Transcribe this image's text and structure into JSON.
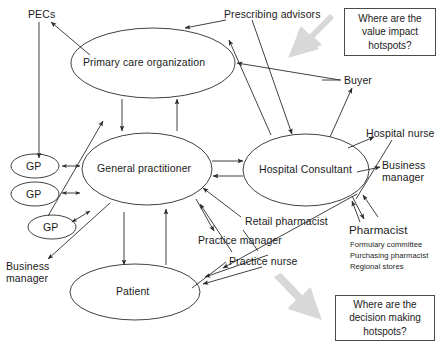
{
  "diagram": {
    "canvas": {
      "width": 441,
      "height": 346
    },
    "style": {
      "stroke": "#2b2b2b",
      "gray_arrow_fill": "#d4d4d4",
      "text_color": "#1b1b1b",
      "background": "#ffffff"
    },
    "ellipses": [
      {
        "id": "primary-care-organization",
        "label": "Primary care organization",
        "cx": 153,
        "cy": 63,
        "rx": 82,
        "ry": 35
      },
      {
        "id": "general-practitioner",
        "label": "General practitioner",
        "cx": 147,
        "cy": 169,
        "rx": 65,
        "ry": 36
      },
      {
        "id": "hospital-consultant",
        "label": "Hospital Consultant",
        "cx": 306,
        "cy": 170,
        "rx": 63,
        "ry": 36
      },
      {
        "id": "patient",
        "label": "Patient",
        "cx": 135,
        "cy": 292,
        "rx": 65,
        "ry": 28
      }
    ],
    "gp_nodes": [
      {
        "id": "gp-1",
        "label": "GP",
        "cx": 35,
        "cy": 166,
        "rx": 24,
        "ry": 12
      },
      {
        "id": "gp-2",
        "label": "GP",
        "cx": 35,
        "cy": 194,
        "rx": 24,
        "ry": 12
      },
      {
        "id": "gp-3",
        "label": "GP",
        "cx": 52,
        "cy": 227,
        "rx": 24,
        "ry": 12
      }
    ],
    "text_nodes": [
      {
        "id": "pecs",
        "label": "PECs",
        "x": 28,
        "y": 8
      },
      {
        "id": "prescribing-advisors",
        "label": "Prescribing advisors",
        "x": 224,
        "y": 8
      },
      {
        "id": "buyer",
        "label": "Buyer",
        "x": 344,
        "y": 75
      },
      {
        "id": "hospital-nurse",
        "label": "Hospital nurse",
        "x": 365,
        "y": 128
      },
      {
        "id": "business-manager-right",
        "label": "Business\nmanager",
        "x": 381,
        "y": 160
      },
      {
        "id": "retail-pharmacist",
        "label": "Retail pharmacist",
        "x": 243,
        "y": 216
      },
      {
        "id": "practice-manager",
        "label": "Practice manager",
        "x": 198,
        "y": 235
      },
      {
        "id": "practice-nurse",
        "label": "Practice nurse",
        "x": 229,
        "y": 256
      },
      {
        "id": "business-manager-left",
        "label": "Business\nmanager",
        "x": 6,
        "y": 260
      },
      {
        "id": "pharmacist",
        "label": "Pharmacist",
        "x": 348,
        "y": 225
      }
    ],
    "pharmacist_sub_items": [
      "Formulary committee",
      "Purchasing pharmacist",
      "Regional stores"
    ],
    "callouts": [
      {
        "id": "value-impact-hotspots",
        "lines": [
          "Where are the",
          "value impact",
          "hotspots?"
        ],
        "x": 344,
        "y": 8,
        "w": 92,
        "h": 48
      },
      {
        "id": "decision-making-hotspots",
        "lines": [
          "Where are the",
          "decision making",
          "hotspots?"
        ],
        "x": 335,
        "y": 295,
        "w": 100,
        "h": 46
      }
    ],
    "gray_arrows": [
      {
        "id": "value-impact-gray-arrow",
        "direction": "down-left"
      },
      {
        "id": "decision-making-gray-arrow",
        "direction": "up-left"
      }
    ]
  }
}
